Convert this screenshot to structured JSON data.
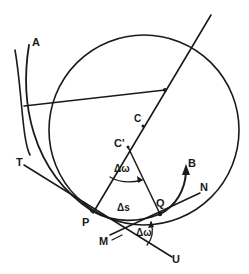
{
  "diagram": {
    "labels": {
      "A": "A",
      "C": "C",
      "C_prime": "C'",
      "T": "T",
      "P": "P",
      "Q": "Q",
      "B": "B",
      "N": "N",
      "M": "M",
      "U": "U",
      "delta_omega_top": "Δω",
      "delta_s": "Δs",
      "delta_omega_bottom": "Δω"
    },
    "colors": {
      "stroke": "#1a1a1a",
      "background": "#ffffff"
    }
  }
}
